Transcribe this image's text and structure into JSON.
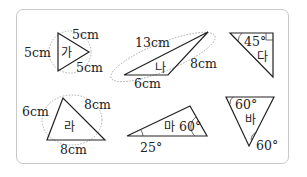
{
  "triangles": [
    {
      "name": "가",
      "labels": [
        "5cm",
        "5cm",
        "5cm"
      ]
    },
    {
      "name": "나",
      "labels": [
        "13cm",
        "8cm",
        "6cm"
      ]
    },
    {
      "name": "다",
      "labels": [
        "45°"
      ]
    },
    {
      "name": "라",
      "labels": [
        "6cm",
        "8cm",
        "8cm"
      ]
    },
    {
      "name": "마",
      "labels": [
        "60°",
        "25°"
      ]
    },
    {
      "name": "바",
      "labels": [
        "60°",
        "60°"
      ]
    }
  ]
}
